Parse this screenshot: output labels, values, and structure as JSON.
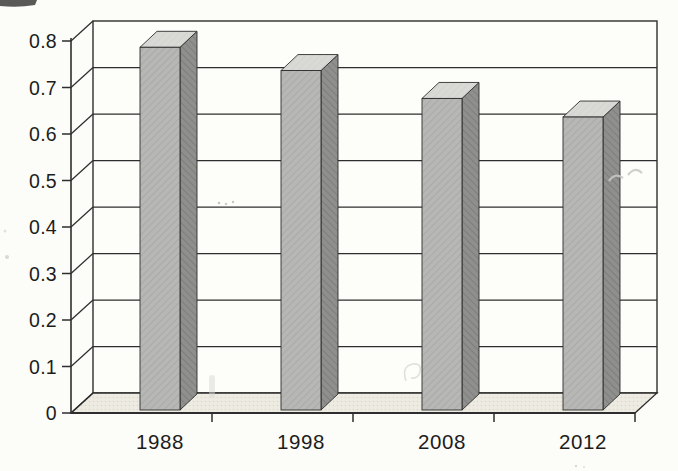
{
  "figure": {
    "kind": "scanned textbook 3-D column chart",
    "title": ""
  },
  "chart_data": {
    "type": "bar",
    "style": "3d-column",
    "title": "",
    "xlabel": "",
    "ylabel": "",
    "categories": [
      "1988",
      "1998",
      "2008",
      "2012"
    ],
    "values": [
      0.78,
      0.73,
      0.67,
      0.63
    ],
    "ylim": [
      0,
      0.8
    ],
    "ytick_step": 0.1,
    "ytick_labels": [
      "0",
      "0.1",
      "0.2",
      "0.3",
      "0.4",
      "0.5",
      "0.6",
      "0.7",
      "0.8"
    ],
    "grid": true,
    "legend": false,
    "colors": {
      "bar_front": "#b7b7b5",
      "bar_front_hatch": "#a7a7a5",
      "bar_side": "#8f8f8d",
      "bar_side_hatch": "#7c7c7a",
      "bar_top": "#d9d9d5",
      "bar_top_hatch": "#cfcfca",
      "floor": "#edebe2",
      "floor_dot": "#dbd9cd",
      "wall": "#fdfdfa",
      "line": "#2e2e2e",
      "text": "#1c1c1c",
      "background": "#fcfcf9"
    }
  }
}
